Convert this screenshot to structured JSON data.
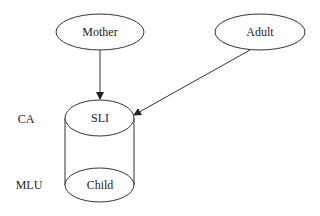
{
  "nodes": {
    "mother": {
      "label": "Mother"
    },
    "adult": {
      "label": "Adult"
    },
    "sli": {
      "label": "SLI"
    },
    "child": {
      "label": "Child"
    }
  },
  "side_labels": {
    "ca": "CA",
    "mlu": "MLU"
  },
  "edges": [
    {
      "from": "Mother",
      "to": "SLI"
    },
    {
      "from": "Adult",
      "to": "SLI"
    }
  ]
}
